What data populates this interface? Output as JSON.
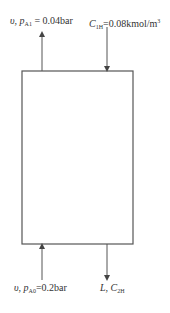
{
  "diagram": {
    "type": "column mass-transfer schematic",
    "top_left": {
      "var1": "υ",
      "sep": ", ",
      "var2": "p",
      "sub": "A1",
      "eq": " = 0.04bar",
      "direction": "out-up"
    },
    "top_right": {
      "var": "C",
      "sub": "1H",
      "eq": "=0.08kmol/m",
      "sup": "3",
      "direction": "in-down"
    },
    "bottom_left": {
      "var1": "υ",
      "sep": ", ",
      "var2": "p",
      "sub": "A0",
      "eq": "=0.2bar",
      "direction": "in-up"
    },
    "bottom_right": {
      "var1": "L",
      "sep": ", ",
      "var2": "C",
      "sub": "2H",
      "direction": "out-down"
    },
    "colors": {
      "line": "#555555",
      "text": "#333333",
      "background": "#ffffff"
    }
  }
}
